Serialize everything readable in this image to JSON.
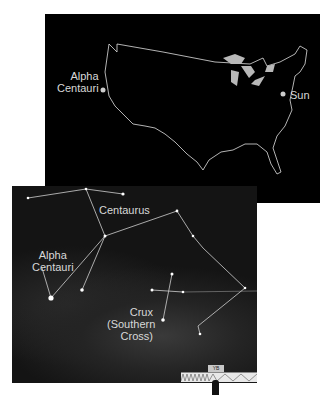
{
  "top_panel": {
    "title": "United States map",
    "labels": {
      "alpha_centauri": "Alpha\nCentauri",
      "sun": "Sun"
    },
    "colors": {
      "background": "#000000",
      "outline": "#e0e0e0",
      "lakes": "#b8b8b8",
      "dots": "#cccccc"
    }
  },
  "bottom_panel": {
    "title": "Star field",
    "labels": {
      "centaurus": "Centaurus",
      "alpha_centauri_line1": "Alpha",
      "alpha_centauri_line2": "Centauri",
      "crux_line1": "Crux",
      "crux_line2": "(Southern",
      "crux_line3": "Cross)"
    },
    "colors": {
      "background": "#141414",
      "lines": "#cfcfcf",
      "stars": "#ffffff"
    }
  },
  "scale": {
    "tag": "YB"
  }
}
